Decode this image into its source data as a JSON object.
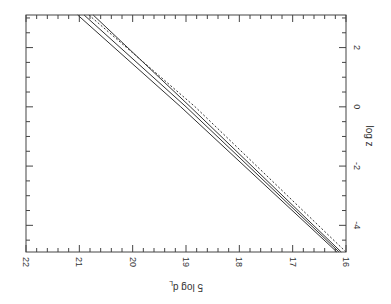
{
  "chart_data": {
    "type": "line",
    "orientation_note": "figure is rotated 90 degrees clockwise; magnitude axis runs along bottom (decreasing left-to-right), log z axis runs along right side",
    "title": "",
    "xlabel": "log z",
    "ylabel": "5 log d_L",
    "xlim": [
      -4.9,
      3.1
    ],
    "ylim": [
      16,
      22
    ],
    "x_ticks": [
      -4,
      -2,
      0,
      2
    ],
    "x_tick_labels": [
      "-4",
      "-2",
      "0",
      "2"
    ],
    "y_ticks": [
      16,
      17,
      18,
      19,
      20,
      21,
      22
    ],
    "y_tick_labels": [
      "16",
      "17",
      "18",
      "19",
      "20",
      "21",
      "22"
    ],
    "grid": false,
    "legend": null,
    "series": [
      {
        "name": "solid-1",
        "style": "solid",
        "x": [
          -4.9,
          0,
          3.1
        ],
        "y": [
          16.17,
          19.1,
          21.03
        ]
      },
      {
        "name": "solid-2",
        "style": "solid",
        "x": [
          -4.9,
          0,
          3.1
        ],
        "y": [
          16.13,
          19.0,
          20.91
        ]
      },
      {
        "name": "solid-3",
        "style": "solid",
        "x": [
          -4.9,
          0,
          3.1
        ],
        "y": [
          16.09,
          18.92,
          20.74
        ]
      },
      {
        "name": "dashed",
        "style": "dashed",
        "x": [
          -4.9,
          0,
          3.1
        ],
        "y": [
          16.0,
          18.83,
          20.82
        ]
      }
    ]
  },
  "labels": {
    "x_axis_title": "log z",
    "y_axis_title": "5 log d",
    "y_axis_subscript": "L"
  }
}
